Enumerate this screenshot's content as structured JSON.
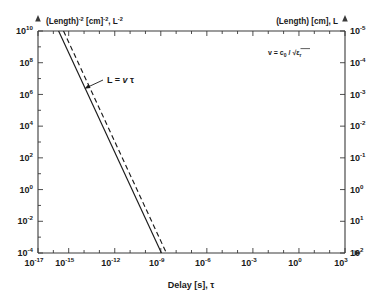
{
  "chart_data": {
    "type": "line",
    "title": "",
    "xlabel": "Delay [s], τ",
    "ylabel_left": "(Length)⁻² [cm]⁻², L⁻²",
    "ylabel_right": "(Length) [cm], L",
    "xscale": "log",
    "yscale": "log",
    "xlim": [
      1e-17,
      1000.0
    ],
    "ylim_left": [
      0.0001,
      10000000000.0
    ],
    "ylim_right": [
      1e-05,
      100.0
    ],
    "y_right_inverted": true,
    "grid": false,
    "legend": "none",
    "xtick_labels": [
      "10⁻¹⁷",
      "10⁻¹⁵",
      "10⁻¹²",
      "10⁻⁹",
      "10⁻⁶",
      "10⁻³",
      "10⁰",
      "10³"
    ],
    "xtick_exponents": [
      -17,
      -15,
      -12,
      -9,
      -6,
      -3,
      0,
      3
    ],
    "ytick_left_exponents": [
      10,
      8,
      6,
      4,
      2,
      0,
      -2,
      -4
    ],
    "ytick_right_exponents": [
      -5,
      -4,
      -3,
      -2,
      -1,
      0,
      1,
      2
    ],
    "series": [
      {
        "name": "L = v tau (solid)",
        "style": "solid",
        "color": "#1a1a1a",
        "points": [
          [
            2.2e-16,
            10000000000.0
          ],
          [
            1.1e-09,
            0.0001
          ]
        ]
      },
      {
        "name": "L = v tau (dashed)",
        "style": "dashed",
        "color": "#1a1a1a",
        "points": [
          [
            4.6e-16,
            10000000000.0
          ],
          [
            2.3e-09,
            0.0001
          ]
        ]
      }
    ],
    "annotations": [
      {
        "name": "relation-label",
        "text": "L = v τ",
        "x_px": 107,
        "y_px": 82
      },
      {
        "name": "velocity-formula",
        "text": "v = c₀ / √εᵣ",
        "x_px": 268,
        "y_px": 54
      }
    ]
  },
  "axes": {
    "x": {
      "title_main": "Delay [s], ",
      "title_symbol": "τ",
      "ticks": [
        {
          "base": "10",
          "exp": "-17"
        },
        {
          "base": "10",
          "exp": "-15"
        },
        {
          "base": "10",
          "exp": "-12"
        },
        {
          "base": "10",
          "exp": "-9"
        },
        {
          "base": "10",
          "exp": "-6"
        },
        {
          "base": "10",
          "exp": "-3"
        },
        {
          "base": "10",
          "exp": "0"
        },
        {
          "base": "10",
          "exp": "3"
        }
      ]
    },
    "y_left": {
      "title_p1": "(Length)",
      "title_e1": "-2",
      "title_p2": " [cm]",
      "title_e2": "-2",
      "title_p3": ", L",
      "title_e3": "-2",
      "ticks": [
        {
          "base": "10",
          "exp": "10"
        },
        {
          "base": "10",
          "exp": "8"
        },
        {
          "base": "10",
          "exp": "6"
        },
        {
          "base": "10",
          "exp": "4"
        },
        {
          "base": "10",
          "exp": "2"
        },
        {
          "base": "10",
          "exp": "0"
        },
        {
          "base": "10",
          "exp": "-2"
        },
        {
          "base": "10",
          "exp": "-4"
        }
      ]
    },
    "y_right": {
      "title": "(Length) [cm], L",
      "ticks": [
        {
          "base": "10",
          "exp": "-5"
        },
        {
          "base": "10",
          "exp": "-4"
        },
        {
          "base": "10",
          "exp": "-3"
        },
        {
          "base": "10",
          "exp": "-2"
        },
        {
          "base": "10",
          "exp": "-1"
        },
        {
          "base": "10",
          "exp": "0"
        },
        {
          "base": "10",
          "exp": "1"
        },
        {
          "base": "10",
          "exp": "2"
        }
      ]
    }
  },
  "annotations": {
    "relation": {
      "lhs": "L = ",
      "v": "v",
      "tau": " τ"
    },
    "formula": {
      "lhs": "v = c",
      "sub0": "0",
      "mid": " / ",
      "radical": "√",
      "eps": "ε",
      "subr": "r"
    }
  },
  "style": {
    "axis_color": "#3a3a3a",
    "curve_color": "#1a1a1a",
    "background": "#ffffff"
  }
}
